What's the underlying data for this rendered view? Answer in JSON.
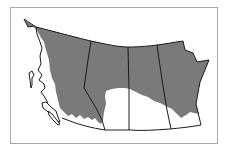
{
  "map": {
    "title": "",
    "region": "Western Canada",
    "regions": [
      {
        "name": "British Columbia"
      },
      {
        "name": "Alberta"
      },
      {
        "name": "Saskatchewan"
      },
      {
        "name": "Manitoba"
      }
    ],
    "colors": {
      "shaded": "#7a7a7a",
      "land": "#ffffff",
      "border": "#1a1a1a",
      "frame": "#a8a8a8"
    },
    "legend": []
  }
}
